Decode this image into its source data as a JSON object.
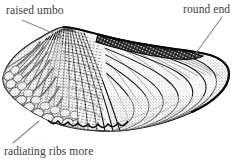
{
  "figure": {
    "width": 238,
    "height": 160,
    "background_color": "#ffffff",
    "ink_color": "#1a1a1a",
    "label_color": "#3b3b3b",
    "leader_color": "#8a8a8a"
  },
  "labels": {
    "raised_umbo": "raised umbo",
    "round_end": "round end",
    "radiating_ribs": "radiating ribs more"
  },
  "leaders": [
    {
      "name": "leader-raised-umbo",
      "from": [
        22,
        20
      ],
      "to": [
        62,
        37
      ]
    },
    {
      "name": "leader-round-end",
      "from": [
        222,
        18
      ],
      "to": [
        196,
        52
      ]
    },
    {
      "name": "leader-radiating-ribs",
      "from": [
        14,
        143
      ],
      "to": [
        38,
        122
      ]
    }
  ],
  "shell": {
    "umbo_apex": [
      64,
      28
    ],
    "left_tip": [
      3,
      78
    ],
    "right_end": [
      228,
      72
    ],
    "ventral_low": [
      120,
      128
    ],
    "hinge_band": "dark dorsal hinge band",
    "radiating_ribs_count": 22,
    "growth_arcs_count": 7
  }
}
